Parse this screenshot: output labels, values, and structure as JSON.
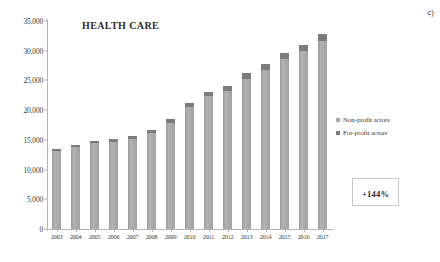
{
  "panel_label": "c)",
  "chart_data": {
    "type": "bar",
    "title": "HEALTH CARE",
    "xlabel": "",
    "ylabel": "",
    "ylim": [
      0,
      35000
    ],
    "ytick_values": [
      0,
      5000,
      10000,
      15000,
      20000,
      25000,
      30000,
      35000
    ],
    "ytick_labels": [
      "0",
      "5,000",
      "10,000",
      "15,000",
      "20,000",
      "25,000",
      "30,000",
      "35,000"
    ],
    "grid": false,
    "stacked": true,
    "legend_position": "right",
    "categories": [
      "2003",
      "2004",
      "2005",
      "2006",
      "2007",
      "2008",
      "2009",
      "2010",
      "2011",
      "2012",
      "2013",
      "2014",
      "2015",
      "2016",
      "2017"
    ],
    "series": [
      {
        "name": "Non-profit actors",
        "color": "#a8a8a8",
        "values": [
          13100,
          13800,
          14400,
          14700,
          15100,
          16200,
          17900,
          20500,
          22300,
          23300,
          25300,
          26800,
          28600,
          29900,
          31700
        ]
      },
      {
        "name": "For-profit actors",
        "color": "#7c7c7c",
        "values": [
          300,
          400,
          400,
          500,
          500,
          500,
          600,
          700,
          700,
          800,
          900,
          900,
          1000,
          1100,
          1100
        ]
      }
    ],
    "totals": [
      13400,
      14200,
      14800,
      15200,
      15600,
      16700,
      18500,
      21200,
      23000,
      24100,
      26200,
      27700,
      29600,
      31000,
      32800
    ],
    "annotations": [
      {
        "name": "growth-callout",
        "text": "+144%"
      }
    ]
  },
  "legend": {
    "items": [
      {
        "label": "Non-profit actors",
        "swatch_class": "sw-non"
      },
      {
        "label": "For-profit actors",
        "swatch_class": "sw-for"
      }
    ]
  },
  "growth_callout": {
    "value": "+144%"
  }
}
